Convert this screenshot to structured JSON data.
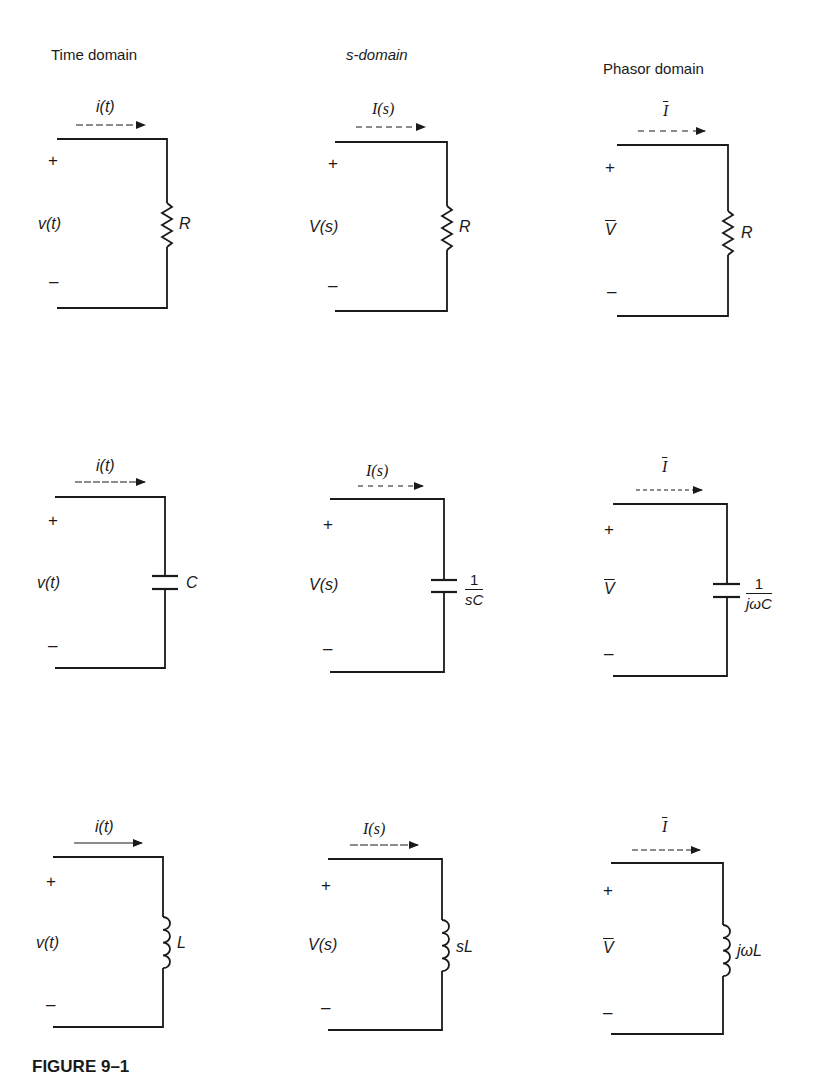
{
  "figure": {
    "caption": "FIGURE 9–1",
    "columns": [
      {
        "heading": "Time domain",
        "current_label": "i(t)",
        "voltage_label": "v(t)",
        "plus": "+",
        "minus": "–"
      },
      {
        "heading": "s-domain",
        "current_label": "I(s)",
        "voltage_label": "V(s)",
        "plus": "+",
        "minus": "–"
      },
      {
        "heading": "Phasor domain",
        "current_label": "I",
        "voltage_label": "V",
        "plus": "+",
        "minus": "–"
      }
    ],
    "rows": [
      {
        "element": "resistor",
        "impedance_labels": {
          "time": "R",
          "s": "R",
          "phasor": "R"
        }
      },
      {
        "element": "capacitor",
        "impedance_labels": {
          "time": "C",
          "s": {
            "num": "1",
            "den": "sC"
          },
          "phasor": {
            "num": "1",
            "den": "jωC"
          }
        }
      },
      {
        "element": "inductor",
        "impedance_labels": {
          "time": "L",
          "s": "sL",
          "phasor": "jωL"
        }
      }
    ]
  }
}
